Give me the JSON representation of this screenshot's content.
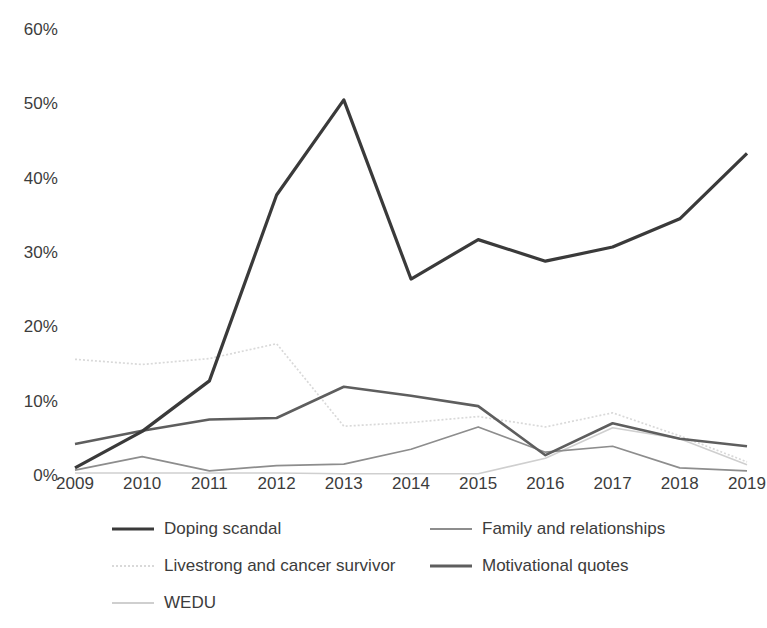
{
  "chart_data": {
    "type": "line",
    "title": "",
    "subtitle": "",
    "xlabel": "",
    "ylabel": "",
    "grid": false,
    "legend_position": "bottom",
    "x": [
      "2009",
      "2010",
      "2011",
      "2012",
      "2013",
      "2014",
      "2015",
      "2016",
      "2017",
      "2018",
      "2019"
    ],
    "categories": [
      "2009",
      "2010",
      "2011",
      "2012",
      "2013",
      "2014",
      "2015",
      "2016",
      "2017",
      "2018",
      "2019"
    ],
    "ylim": [
      0,
      60
    ],
    "ytick_labels": [
      "0%",
      "10%",
      "20%",
      "30%",
      "40%",
      "50%",
      "60%"
    ],
    "ytick_values": [
      0,
      10,
      20,
      30,
      40,
      50,
      60
    ],
    "value_suffix": "%",
    "series": [
      {
        "name": "Doping scandal",
        "color": "#3a3a3a",
        "width": 3.2,
        "dash": "none",
        "values": [
          1.1,
          6.0,
          12.8,
          37.8,
          50.6,
          26.5,
          31.8,
          28.9,
          30.8,
          34.6,
          43.4
        ]
      },
      {
        "name": "Family and relationships",
        "color": "#8d8d8d",
        "width": 1.7,
        "dash": "none",
        "values": [
          0.8,
          2.6,
          0.7,
          1.4,
          1.6,
          3.6,
          6.6,
          3.2,
          4.0,
          1.1,
          0.7
        ]
      },
      {
        "name": "Livestrong and cancer survivor",
        "color": "#d9d9d9",
        "width": 1.7,
        "dash": "dotted",
        "values": [
          15.7,
          15.0,
          15.8,
          17.8,
          6.7,
          7.2,
          8.0,
          6.6,
          8.5,
          5.4,
          1.9
        ]
      },
      {
        "name": "Motivational quotes",
        "color": "#5e5e5e",
        "width": 2.6,
        "dash": "none",
        "values": [
          4.3,
          6.1,
          7.6,
          7.8,
          12.0,
          10.8,
          9.4,
          2.8,
          7.1,
          5.0,
          4.0
        ]
      },
      {
        "name": "WEDU",
        "color": "#cfcfcf",
        "width": 1.6,
        "dash": "none",
        "values": [
          0.4,
          0.4,
          0.4,
          0.4,
          0.3,
          0.3,
          0.3,
          2.4,
          6.5,
          5.0,
          1.5
        ]
      }
    ]
  },
  "legend": {
    "items": [
      {
        "label": "Doping scandal",
        "color": "#3a3a3a",
        "width": 3.2,
        "dash": "none"
      },
      {
        "label": "Family and relationships",
        "color": "#8d8d8d",
        "width": 1.7,
        "dash": "none"
      },
      {
        "label": "Livestrong and cancer survivor",
        "color": "#d9d9d9",
        "width": 1.7,
        "dash": "dotted"
      },
      {
        "label": "Motivational quotes",
        "color": "#5e5e5e",
        "width": 2.6,
        "dash": "none"
      },
      {
        "label": "WEDU",
        "color": "#cfcfcf",
        "width": 1.6,
        "dash": "none"
      }
    ],
    "layout": [
      {
        "col": 0,
        "row": 0,
        "series_index": 0
      },
      {
        "col": 1,
        "row": 0,
        "series_index": 1
      },
      {
        "col": 0,
        "row": 1,
        "series_index": 2
      },
      {
        "col": 1,
        "row": 1,
        "series_index": 3
      },
      {
        "col": 0,
        "row": 2,
        "series_index": 4
      }
    ]
  }
}
